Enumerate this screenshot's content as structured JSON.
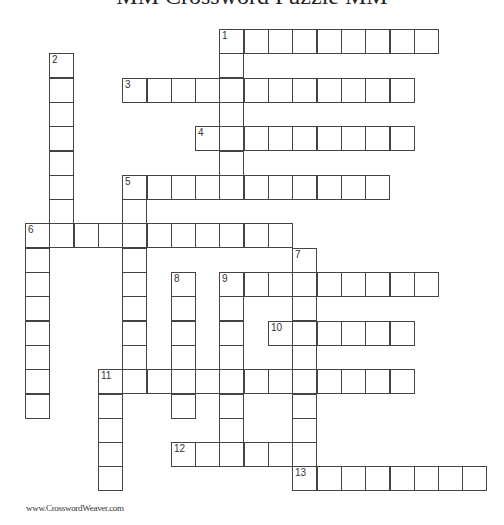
{
  "title": "MM Crossword Puzzle MM",
  "footer": "www.CrosswordWeaver.com",
  "grid": {
    "origin_x": 25,
    "origin_y": 29,
    "cell_size": 24.3,
    "entries": [
      {
        "number": "1",
        "direction": "across",
        "row": 0,
        "col": 8,
        "length": 9
      },
      {
        "number": "1",
        "direction": "down",
        "row": 0,
        "col": 8,
        "length": 7
      },
      {
        "number": "2",
        "direction": "down",
        "row": 1,
        "col": 1,
        "length": 8
      },
      {
        "number": "3",
        "direction": "across",
        "row": 2,
        "col": 4,
        "length": 12
      },
      {
        "number": "4",
        "direction": "across",
        "row": 4,
        "col": 7,
        "length": 9
      },
      {
        "number": "5",
        "direction": "across",
        "row": 6,
        "col": 4,
        "length": 11
      },
      {
        "number": "5",
        "direction": "down",
        "row": 6,
        "col": 4,
        "length": 9
      },
      {
        "number": "6",
        "direction": "across",
        "row": 8,
        "col": 0,
        "length": 11
      },
      {
        "number": "6",
        "direction": "down",
        "row": 8,
        "col": 0,
        "length": 8
      },
      {
        "number": "7",
        "direction": "down",
        "row": 9,
        "col": 11,
        "length": 10
      },
      {
        "number": "8",
        "direction": "down",
        "row": 10,
        "col": 6,
        "length": 6
      },
      {
        "number": "9",
        "direction": "across",
        "row": 10,
        "col": 8,
        "length": 9
      },
      {
        "number": "9",
        "direction": "down",
        "row": 10,
        "col": 8,
        "length": 8
      },
      {
        "number": "10",
        "direction": "across",
        "row": 12,
        "col": 10,
        "length": 6
      },
      {
        "number": "11",
        "direction": "across",
        "row": 14,
        "col": 3,
        "length": 13
      },
      {
        "number": "11",
        "direction": "down",
        "row": 14,
        "col": 3,
        "length": 5
      },
      {
        "number": "12",
        "direction": "across",
        "row": 17,
        "col": 6,
        "length": 6
      },
      {
        "number": "13",
        "direction": "across",
        "row": 18,
        "col": 11,
        "length": 8
      }
    ]
  }
}
